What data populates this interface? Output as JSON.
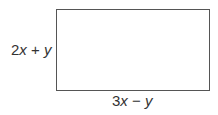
{
  "diagram": {
    "shape": "rectangle",
    "height_label": {
      "coef": "2",
      "var1": "x",
      "op": "+",
      "var2": "y"
    },
    "width_label": {
      "coef": "3",
      "var1": "x",
      "op": "−",
      "var2": "y"
    }
  }
}
